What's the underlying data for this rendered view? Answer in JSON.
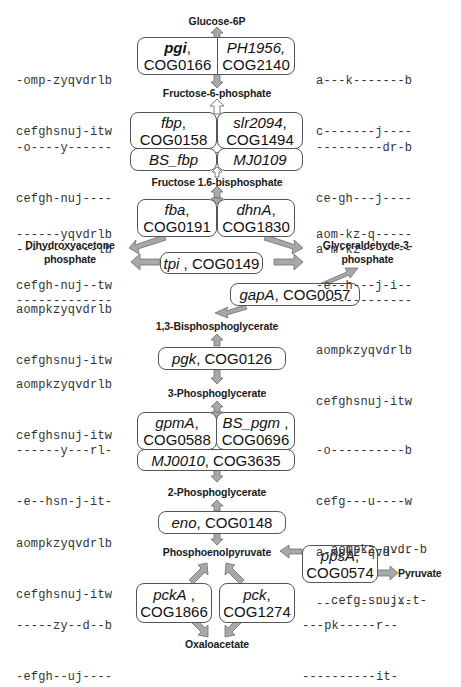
{
  "diagram": {
    "type": "metabolic-pathway",
    "metabolites": {
      "g6p": "Glucose-6P",
      "f6p": "Fructose-6-phosphate",
      "fbp": "Fructose 1.6-bisphosphate",
      "dhap_1": "Dihydroxyacetone",
      "dhap_2": "phosphate",
      "g3p_1": "Glyceraldehyde-3-",
      "g3p_2": "phosphate",
      "bpg": "1,3-Bisphosphoglycerate",
      "pg3": "3-Phosphoglycerate",
      "pg2": "2-Phosphoglycerate",
      "pep": "Phosphoenolpyruvate",
      "pyr": "Pyruvate",
      "oaa": "Oxaloacetate"
    },
    "enzymes": {
      "pgi": {
        "gene": "pgi",
        "cog": "COG0166"
      },
      "ph1956": {
        "gene": "PH1956,",
        "cog": "COG2140"
      },
      "fbp": {
        "gene": "fbp",
        "cog": "COG0158"
      },
      "slr2094": {
        "gene": "slr2094",
        "cog": "COG1494"
      },
      "bs_fbp": {
        "gene": "BS_fbp"
      },
      "mj0109": {
        "gene": "MJ0109"
      },
      "fba": {
        "gene": "fba",
        "cog": "COG0191"
      },
      "dhnA": {
        "gene": "dhnA",
        "cog": "COG1830"
      },
      "tpi": {
        "gene": "tpi",
        "cog": "COG0149"
      },
      "gapA": {
        "gene": "gapA",
        "cog": "COG0057"
      },
      "pgk": {
        "gene": "pgk",
        "cog": "COG0126"
      },
      "gpmA": {
        "gene": "gpmA",
        "cog": "COG0588"
      },
      "bs_pgm": {
        "gene": "BS_pgm",
        "cog": "COG0696"
      },
      "mj0010": {
        "gene": "MJ0010",
        "cog": "COG3635"
      },
      "eno": {
        "gene": "eno",
        "cog": "COG0148"
      },
      "ppsA": {
        "gene": "ppsA",
        "cog": "COG0574"
      },
      "pckA": {
        "gene": "pckA",
        "cog": "COG1866"
      },
      "pck": {
        "gene": "pck",
        "cog": "COG1274"
      }
    },
    "separators": {
      "comma": ","
    },
    "profiles": {
      "pgi": [
        "-omp-zyqvdrlb",
        "cefghsnuj-itw"
      ],
      "ph1956": [
        "a---k-------b",
        "c-------j----"
      ],
      "fbp_left": [
        "-o----y------",
        "cefgh-nuj----",
        "-----------lb",
        "-------------"
      ],
      "fbp_right": [
        "---------dr-b",
        "ce-gh---j----",
        "a-m-kz-------",
        "-------------"
      ],
      "fba": [
        "------yqvdrlb",
        "cefgh-nuj--tw"
      ],
      "dhnA": [
        "aom-kz-q-----",
        "-e--h---j-i--"
      ],
      "tpi": [
        "aompkzyqvdrlb",
        "cefghsnuj-itw"
      ],
      "gapA": [
        "aompkzyqvdrlb",
        "cefghsnuj-itw"
      ],
      "pgk": [
        "aompkzyqvdrlb",
        "cefghsnuj-itw"
      ],
      "gpm_left": [
        "------y---rl-",
        "-e--hsn-j-it-"
      ],
      "gpm_right": [
        "-o----------b",
        "cefg---u----w",
        "a-mpkz-qvd---",
        "-------------"
      ],
      "eno": [
        "aompkzyqvdrlb",
        "cefghsnuj-itw"
      ],
      "ppsA": [
        "aompkz-qvdr-b",
        "cefg-snujx-t-"
      ],
      "pckA": [
        "-----zy--d--b",
        "-efgh--uj----"
      ],
      "pck": [
        "---pk-----r--",
        "----------it-"
      ]
    },
    "colors": {
      "arrow_fill": "#a8a8a8",
      "arrow_stroke": "#6e6e6e",
      "box_border": "#555555",
      "text": "#111111"
    }
  }
}
